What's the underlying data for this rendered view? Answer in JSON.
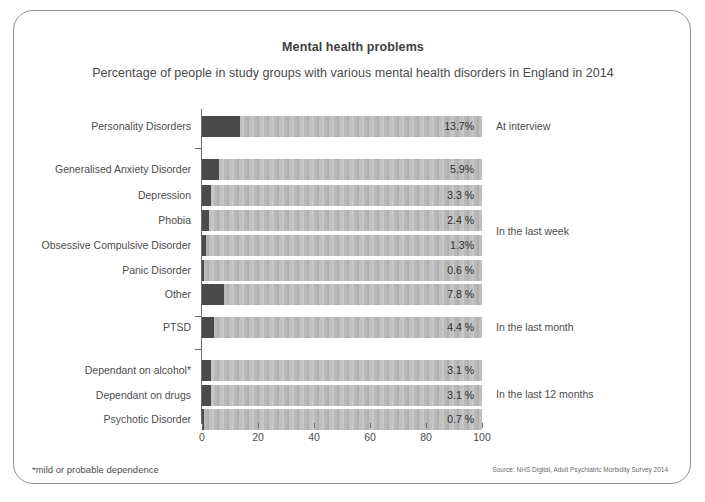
{
  "chart_data": {
    "type": "bar",
    "orientation": "horizontal",
    "title": "Mental health problems",
    "subtitle": "Percentage of people in study groups with various mental health disorders in England in 2014",
    "xlabel": "",
    "ylabel": "",
    "xlim": [
      0,
      100
    ],
    "xticks": [
      "0",
      "20",
      "40",
      "60",
      "80",
      "100"
    ],
    "grid": false,
    "legend": "none",
    "value_suffix": "%",
    "categories": [
      "Personality Disorders",
      "Generalised Anxiety Disorder",
      "Depression",
      "Phobia",
      "Obsessive Compulsive Disorder",
      "Panic Disorder",
      "Other",
      "PTSD",
      "Dependant on alcohol*",
      "Dependant on drugs",
      "Psychotic Disorder"
    ],
    "values": [
      13.7,
      5.9,
      3.3,
      2.4,
      1.3,
      0.6,
      7.8,
      4.4,
      3.1,
      3.1,
      0.7
    ],
    "value_labels": [
      "13.7%",
      "5.9%",
      "3.3 %",
      "2.4 %",
      "1.3%",
      "0.6 %",
      "7.8 %",
      "4.4 %",
      "3.1 %",
      "3.1 %",
      "0.7 %"
    ],
    "groups": [
      {
        "label": "At interview",
        "categories": [
          "Personality Disorders"
        ]
      },
      {
        "label": "In the last week",
        "categories": [
          "Generalised Anxiety Disorder",
          "Depression",
          "Phobia",
          "Obsessive Compulsive Disorder",
          "Panic Disorder",
          "Other"
        ]
      },
      {
        "label": "In the last month",
        "categories": [
          "PTSD"
        ]
      },
      {
        "label": "In the last 12 months",
        "categories": [
          "Dependant on alcohol*",
          "Dependant on drugs",
          "Psychotic Disorder"
        ]
      }
    ],
    "colors": {
      "fill": "#4a4a4a",
      "track": "#b9b9b9",
      "axis": "#6f6f6f",
      "text": "#4d4d4d",
      "border": "#8e8e8e"
    }
  },
  "footnote": "*mild or probable dependence",
  "source": "Source: NHS Digital, Adult Psychiatric Morbidity Survey 2014"
}
